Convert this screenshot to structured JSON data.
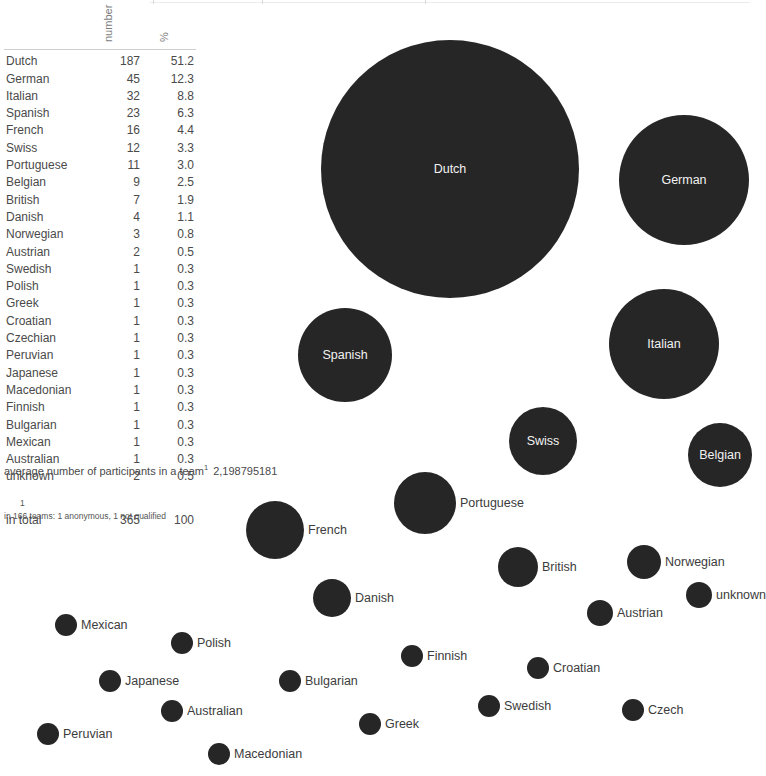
{
  "table": {
    "columns": [
      "",
      "number",
      "%"
    ],
    "header_number_label": "number",
    "header_percent_label": "%",
    "rows": [
      {
        "name": "Dutch",
        "number": "187",
        "percent": "51.2"
      },
      {
        "name": "German",
        "number": "45",
        "percent": "12.3"
      },
      {
        "name": "Italian",
        "number": "32",
        "percent": "8.8"
      },
      {
        "name": "Spanish",
        "number": "23",
        "percent": "6.3"
      },
      {
        "name": "French",
        "number": "16",
        "percent": "4.4"
      },
      {
        "name": "Swiss",
        "number": "12",
        "percent": "3.3"
      },
      {
        "name": "Portuguese",
        "number": "11",
        "percent": "3.0"
      },
      {
        "name": "Belgian",
        "number": "9",
        "percent": "2.5"
      },
      {
        "name": "British",
        "number": "7",
        "percent": "1.9"
      },
      {
        "name": "Danish",
        "number": "4",
        "percent": "1.1"
      },
      {
        "name": "Norwegian",
        "number": "3",
        "percent": "0.8"
      },
      {
        "name": "Austrian",
        "number": "2",
        "percent": "0.5"
      },
      {
        "name": "Swedish",
        "number": "1",
        "percent": "0.3"
      },
      {
        "name": "Polish",
        "number": "1",
        "percent": "0.3"
      },
      {
        "name": "Greek",
        "number": "1",
        "percent": "0.3"
      },
      {
        "name": "Croatian",
        "number": "1",
        "percent": "0.3"
      },
      {
        "name": "Czechian",
        "number": "1",
        "percent": "0.3"
      },
      {
        "name": "Peruvian",
        "number": "1",
        "percent": "0.3"
      },
      {
        "name": "Japanese",
        "number": "1",
        "percent": "0.3"
      },
      {
        "name": "Macedonian",
        "number": "1",
        "percent": "0.3"
      },
      {
        "name": "Finnish",
        "number": "1",
        "percent": "0.3"
      },
      {
        "name": "Bulgarian",
        "number": "1",
        "percent": "0.3"
      },
      {
        "name": "Mexican",
        "number": "1",
        "percent": "0.3"
      },
      {
        "name": "Australian",
        "number": "1",
        "percent": "0.3"
      },
      {
        "name": "unknown",
        "number": "2",
        "percent": "0.5"
      }
    ],
    "total": {
      "name": "in total",
      "number": "365",
      "percent": "100"
    }
  },
  "notes": {
    "average_label": "average number of participants in a team",
    "average_marker": "1",
    "average_value": "2,198795181",
    "footnote_marker": "1",
    "footnote_text": "in 166 teams: 1 anonymous, 1 not qualified"
  },
  "colors": {
    "bubble_fill": "#262626",
    "label_inside": "#f2f2f2",
    "label_outside": "#3c3c3c",
    "background": "#ffffff",
    "rule": "#cfcfcf"
  },
  "chart_data": {
    "type": "scatter",
    "title": "",
    "xlabel": "",
    "ylabel": "",
    "legend": "none",
    "grid": false,
    "size_encoding": "area proportional to number of participants",
    "categories": [
      "Dutch",
      "German",
      "Italian",
      "Spanish",
      "Swiss",
      "Belgian",
      "Portuguese",
      "French",
      "British",
      "Danish",
      "Norwegian",
      "Austrian",
      "unknown",
      "Mexican",
      "Polish",
      "Japanese",
      "Bulgarian",
      "Australian",
      "Peruvian",
      "Macedonian",
      "Greek",
      "Swedish",
      "Croatian",
      "Finnish",
      "Czech"
    ],
    "values": [
      187,
      45,
      32,
      23,
      12,
      9,
      11,
      16,
      7,
      4,
      3,
      2,
      2,
      1,
      1,
      1,
      1,
      1,
      1,
      1,
      1,
      1,
      1,
      1,
      1
    ],
    "percents": [
      51.2,
      12.3,
      8.8,
      6.3,
      3.3,
      2.5,
      3.0,
      4.4,
      1.9,
      1.1,
      0.8,
      0.5,
      0.5,
      0.3,
      0.3,
      0.3,
      0.3,
      0.3,
      0.3,
      0.3,
      0.3,
      0.3,
      0.3,
      0.3,
      0.3
    ],
    "bubbles": [
      {
        "label": "Dutch",
        "value": 187,
        "cx": 450,
        "cy": 169,
        "r": 129,
        "label_pos": "inside"
      },
      {
        "label": "German",
        "value": 45,
        "cx": 684,
        "cy": 180,
        "r": 65,
        "label_pos": "inside"
      },
      {
        "label": "Italian",
        "value": 32,
        "cx": 664,
        "cy": 344,
        "r": 55,
        "label_pos": "inside"
      },
      {
        "label": "Spanish",
        "value": 23,
        "cx": 345,
        "cy": 355,
        "r": 47,
        "label_pos": "inside"
      },
      {
        "label": "French",
        "value": 16,
        "cx": 275,
        "cy": 530,
        "r": 29,
        "label_pos": "outside"
      },
      {
        "label": "Swiss",
        "value": 12,
        "cx": 543,
        "cy": 441,
        "r": 34,
        "label_pos": "inside"
      },
      {
        "label": "Portuguese",
        "value": 11,
        "cx": 425,
        "cy": 503,
        "r": 31,
        "label_pos": "outside"
      },
      {
        "label": "Belgian",
        "value": 9,
        "cx": 720,
        "cy": 455,
        "r": 32,
        "label_pos": "inside"
      },
      {
        "label": "British",
        "value": 7,
        "cx": 518,
        "cy": 567,
        "r": 20,
        "label_pos": "outside"
      },
      {
        "label": "Danish",
        "value": 4,
        "cx": 332,
        "cy": 598,
        "r": 19,
        "label_pos": "outside"
      },
      {
        "label": "Norwegian",
        "value": 3,
        "cx": 644,
        "cy": 562,
        "r": 17,
        "label_pos": "outside"
      },
      {
        "label": "Austrian",
        "value": 2,
        "cx": 600,
        "cy": 613,
        "r": 13,
        "label_pos": "outside"
      },
      {
        "label": "unknown",
        "value": 2,
        "cx": 699,
        "cy": 595,
        "r": 13,
        "label_pos": "outside"
      },
      {
        "label": "Mexican",
        "value": 1,
        "cx": 66,
        "cy": 625,
        "r": 11,
        "label_pos": "outside"
      },
      {
        "label": "Polish",
        "value": 1,
        "cx": 182,
        "cy": 643,
        "r": 11,
        "label_pos": "outside"
      },
      {
        "label": "Japanese",
        "value": 1,
        "cx": 110,
        "cy": 681,
        "r": 11,
        "label_pos": "outside"
      },
      {
        "label": "Bulgarian",
        "value": 1,
        "cx": 290,
        "cy": 681,
        "r": 11,
        "label_pos": "outside"
      },
      {
        "label": "Australian",
        "value": 1,
        "cx": 172,
        "cy": 711,
        "r": 11,
        "label_pos": "outside"
      },
      {
        "label": "Peruvian",
        "value": 1,
        "cx": 48,
        "cy": 734,
        "r": 11,
        "label_pos": "outside"
      },
      {
        "label": "Macedonian",
        "value": 1,
        "cx": 219,
        "cy": 754,
        "r": 11,
        "label_pos": "outside"
      },
      {
        "label": "Greek",
        "value": 1,
        "cx": 370,
        "cy": 724,
        "r": 11,
        "label_pos": "outside"
      },
      {
        "label": "Swedish",
        "value": 1,
        "cx": 489,
        "cy": 706,
        "r": 11,
        "label_pos": "outside"
      },
      {
        "label": "Croatian",
        "value": 1,
        "cx": 538,
        "cy": 668,
        "r": 11,
        "label_pos": "outside"
      },
      {
        "label": "Finnish",
        "value": 1,
        "cx": 412,
        "cy": 656,
        "r": 11,
        "label_pos": "outside"
      },
      {
        "label": "Czech",
        "value": 1,
        "cx": 633,
        "cy": 710,
        "r": 11,
        "label_pos": "outside"
      }
    ]
  }
}
